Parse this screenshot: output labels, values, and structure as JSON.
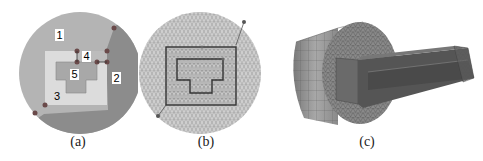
{
  "figure": {
    "panels": [
      {
        "id": "a",
        "caption": "(a)",
        "description": "Circular cross-section partitioned into 5 numbered regions",
        "region_labels": [
          "1",
          "2",
          "3",
          "4",
          "5"
        ],
        "colors": {
          "region1": "#b4b4b4",
          "region2": "#8c8c8c",
          "region3": "#dcdcdc",
          "region4": "#bcbcbc",
          "region5": "#a8a8a8",
          "vertex": "#6a4a4a",
          "label_bg": "#ffffff"
        }
      },
      {
        "id": "b",
        "caption": "(b)",
        "description": "Triangulated mesh of the circular cross-section with region boundaries",
        "colors": {
          "fill": "#cfcfcf",
          "mesh": "#8a8a8a",
          "boundary": "#333333"
        }
      },
      {
        "id": "c",
        "caption": "(c)",
        "description": "3D meshed cylinder with extruded rectangular conductor",
        "colors": {
          "cylinder_side": "#9a9a9a",
          "cylinder_face": "#7a7a7a",
          "extrusion": "#505050"
        }
      }
    ]
  }
}
